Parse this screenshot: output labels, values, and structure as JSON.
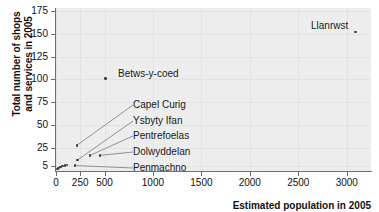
{
  "chart_data": {
    "type": "scatter",
    "title": "",
    "xlabel": "Estimated population in 2005",
    "ylabel_line1": "Total number of shops",
    "ylabel_line2": "and services in 2005",
    "xlim": [
      0,
      3250
    ],
    "ylim": [
      0,
      178
    ],
    "grid": true,
    "legend": "none",
    "xticks": [
      {
        "value": 0,
        "label": "0"
      },
      {
        "value": 250,
        "label": "250"
      },
      {
        "value": 500,
        "label": "500"
      },
      {
        "value": 1000,
        "label": "1000"
      },
      {
        "value": 1500,
        "label": "1500"
      },
      {
        "value": 2000,
        "label": "2000"
      },
      {
        "value": 2500,
        "label": "2500"
      },
      {
        "value": 3000,
        "label": "3000"
      }
    ],
    "yticks": [
      {
        "value": 5,
        "label": "5"
      },
      {
        "value": 25,
        "label": "25"
      },
      {
        "value": 50,
        "label": "50"
      },
      {
        "value": 75,
        "label": "75"
      },
      {
        "value": 100,
        "label": "100"
      },
      {
        "value": 125,
        "label": "125"
      },
      {
        "value": 150,
        "label": "150"
      },
      {
        "value": 175,
        "label": "175"
      }
    ],
    "points": [
      {
        "name": "Llanrwst",
        "x": 3090,
        "y": 152,
        "labelled": true
      },
      {
        "name": "Betws-y-coed",
        "x": 512,
        "y": 101,
        "labelled": true
      },
      {
        "name": "Capel Curig",
        "x": 215,
        "y": 28,
        "labelled": true
      },
      {
        "name": "Ysbyty Ifan",
        "x": 222,
        "y": 12,
        "labelled": true
      },
      {
        "name": "Pentrefoelas",
        "x": 352,
        "y": 17,
        "labelled": true
      },
      {
        "name": "Dolwyddelan",
        "x": 452,
        "y": 17,
        "labelled": true
      },
      {
        "name": "Penmachno",
        "x": 196,
        "y": 6,
        "labelled": true
      },
      {
        "name": "",
        "x": 118,
        "y": 7,
        "labelled": false
      },
      {
        "name": "",
        "x": 96,
        "y": 6,
        "labelled": false
      },
      {
        "name": "",
        "x": 72,
        "y": 5,
        "labelled": false
      },
      {
        "name": "",
        "x": 58,
        "y": 5,
        "labelled": false
      },
      {
        "name": "",
        "x": 46,
        "y": 4,
        "labelled": false
      },
      {
        "name": "",
        "x": 38,
        "y": 4,
        "labelled": false
      },
      {
        "name": "",
        "x": 30,
        "y": 3,
        "labelled": false
      },
      {
        "name": "",
        "x": 24,
        "y": 3,
        "labelled": false
      },
      {
        "name": "",
        "x": 18,
        "y": 2,
        "labelled": false
      },
      {
        "name": "",
        "x": 12,
        "y": 2,
        "labelled": false
      }
    ],
    "annotations": [
      {
        "text": "Llanrwst",
        "anchor": "right"
      },
      {
        "text": "Betws-y-coed",
        "anchor": "left"
      },
      {
        "text": "Capel Curig",
        "anchor": "leader"
      },
      {
        "text": "Ysbyty Ifan",
        "anchor": "leader"
      },
      {
        "text": "Pentrefoelas",
        "anchor": "leader"
      },
      {
        "text": "Dolwyddelan",
        "anchor": "leader"
      },
      {
        "text": "Penmachno",
        "anchor": "leader"
      }
    ]
  },
  "colors": {
    "plot_background": "#ededed",
    "gridline": "#e2e2e2",
    "axis": "#6f6f6f",
    "point": "#3d3d3d",
    "text": "#111111",
    "leader": "#7a7a7a"
  }
}
